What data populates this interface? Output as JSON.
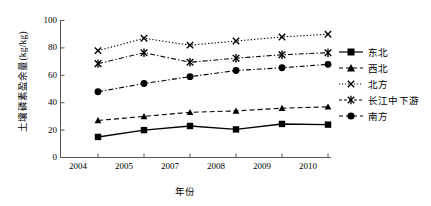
{
  "chart_data": {
    "type": "line",
    "title": "",
    "xlabel": "年份",
    "ylabel": "土壤磷素盈余量(kg/kg)",
    "categories": [
      "2004",
      "2005",
      "2007",
      "2008",
      "2009",
      "2010"
    ],
    "ylim": [
      0,
      100
    ],
    "yticks": [
      "0",
      "20",
      "40",
      "60",
      "80",
      "100"
    ],
    "ytick_values": [
      0,
      20,
      40,
      60,
      80,
      100
    ],
    "grid": false,
    "legend_position": "right",
    "series": [
      {
        "name": "东北",
        "marker": "square",
        "linestyle": "solid",
        "color": "#000000",
        "values": [
          15,
          20,
          23,
          20.5,
          24.5,
          24
        ]
      },
      {
        "name": "西北",
        "marker": "triangle",
        "linestyle": "dashed",
        "color": "#000000",
        "values": [
          27,
          30,
          33,
          34,
          36,
          37
        ]
      },
      {
        "name": "北方",
        "marker": "x",
        "linestyle": "dotted",
        "color": "#000000",
        "values": [
          78,
          87,
          82,
          85,
          88,
          90
        ]
      },
      {
        "name": "长江中下游",
        "marker": "asterisk",
        "linestyle": "dashdot",
        "color": "#000000",
        "values": [
          68.5,
          76.5,
          69.5,
          72.5,
          75,
          76.5
        ]
      },
      {
        "name": "南方",
        "marker": "circle",
        "linestyle": "dashdot",
        "color": "#000000",
        "values": [
          48,
          54,
          59,
          63.5,
          65.5,
          68
        ]
      }
    ]
  },
  "axis": {
    "y_title": "土壤磷素盈余量(kg/kg)",
    "x_title": "年份",
    "y_labels": [
      "100",
      "80",
      "60",
      "40",
      "20",
      "0"
    ],
    "x_labels": [
      "2004",
      "2005",
      "2007",
      "2008",
      "2009",
      "2010"
    ]
  },
  "legend": {
    "items": [
      {
        "label": "东北"
      },
      {
        "label": "西北"
      },
      {
        "label": "北方"
      },
      {
        "label": "长江中下游"
      },
      {
        "label": "南方"
      }
    ]
  }
}
